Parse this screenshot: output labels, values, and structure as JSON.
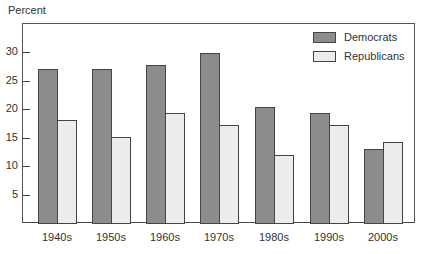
{
  "chart_data": {
    "type": "bar",
    "title": "",
    "ylabel": "Percent",
    "xlabel": "",
    "categories": [
      "1940s",
      "1950s",
      "1960s",
      "1970s",
      "1980s",
      "1990s",
      "2000s"
    ],
    "series": [
      {
        "name": "Democrats",
        "color": "#8c8c8c",
        "values": [
          27,
          27,
          27.7,
          29.8,
          20.3,
          19.3,
          13
        ]
      },
      {
        "name": "Republicans",
        "color": "#ececec",
        "values": [
          18,
          15,
          19.3,
          17.2,
          12,
          17.2,
          14.2
        ]
      }
    ],
    "yticks": [
      5,
      10,
      15,
      20,
      25,
      30
    ],
    "ylim": [
      0,
      35
    ],
    "grid": false,
    "legend_position": "top-right"
  }
}
